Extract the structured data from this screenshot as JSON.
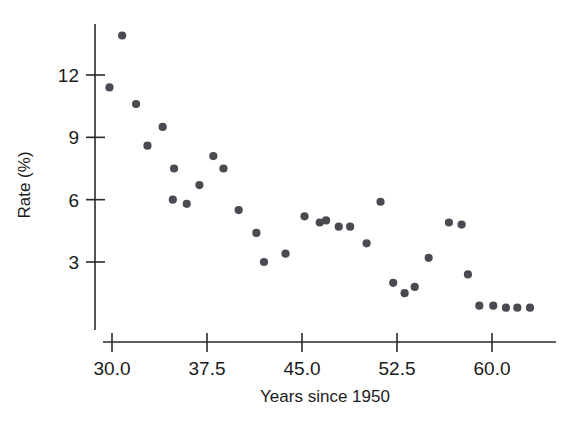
{
  "chart_data": {
    "type": "scatter",
    "title": "",
    "xlabel": "Years since 1950",
    "ylabel": "Rate (%)",
    "xlim": [
      28.6,
      64.5
    ],
    "ylim": [
      0.0,
      14.5
    ],
    "grid": false,
    "legend": null,
    "xticks": [
      30.0,
      37.5,
      45.0,
      52.5,
      60.0
    ],
    "xticklabels": [
      "30.0",
      "37.5",
      "45.0",
      "52.5",
      "60.0"
    ],
    "yticks": [
      3,
      6,
      9,
      12
    ],
    "yticklabels": [
      "3",
      "6",
      "9",
      "12"
    ],
    "marker": "circle",
    "marker_color": "#4a4a52",
    "points": [
      {
        "x": 30.8,
        "y": 13.9
      },
      {
        "x": 29.8,
        "y": 11.4
      },
      {
        "x": 31.9,
        "y": 10.6
      },
      {
        "x": 34.0,
        "y": 9.5
      },
      {
        "x": 32.8,
        "y": 8.6
      },
      {
        "x": 34.9,
        "y": 7.5
      },
      {
        "x": 38.0,
        "y": 8.1
      },
      {
        "x": 38.8,
        "y": 7.5
      },
      {
        "x": 36.9,
        "y": 6.7
      },
      {
        "x": 34.8,
        "y": 6.0
      },
      {
        "x": 35.9,
        "y": 5.8
      },
      {
        "x": 40.0,
        "y": 5.5
      },
      {
        "x": 43.7,
        "y": 3.4
      },
      {
        "x": 42.0,
        "y": 3.0
      },
      {
        "x": 41.4,
        "y": 4.4
      },
      {
        "x": 45.2,
        "y": 5.2
      },
      {
        "x": 46.4,
        "y": 4.9
      },
      {
        "x": 46.9,
        "y": 5.0
      },
      {
        "x": 47.9,
        "y": 4.7
      },
      {
        "x": 48.8,
        "y": 4.7
      },
      {
        "x": 51.2,
        "y": 5.9
      },
      {
        "x": 50.1,
        "y": 3.9
      },
      {
        "x": 52.2,
        "y": 2.0
      },
      {
        "x": 53.1,
        "y": 1.5
      },
      {
        "x": 53.9,
        "y": 1.8
      },
      {
        "x": 55.0,
        "y": 3.2
      },
      {
        "x": 56.6,
        "y": 4.9
      },
      {
        "x": 57.6,
        "y": 4.8
      },
      {
        "x": 58.1,
        "y": 2.4
      },
      {
        "x": 59.0,
        "y": 0.9
      },
      {
        "x": 60.1,
        "y": 0.9
      },
      {
        "x": 61.1,
        "y": 0.8
      },
      {
        "x": 62.0,
        "y": 0.8
      },
      {
        "x": 63.0,
        "y": 0.8
      }
    ]
  }
}
